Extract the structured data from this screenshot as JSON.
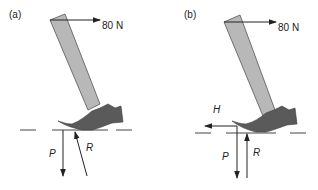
{
  "figure": {
    "colors": {
      "handle_fill": "#b8b8b8",
      "handle_stroke": "#555555",
      "head_fill": "#5a5a5a",
      "arrow": "#222222",
      "ground_dash": "#444444",
      "background": "#ffffff"
    },
    "panels": [
      {
        "id": "a",
        "label": "(a)",
        "applied_force": {
          "label": "80 N",
          "direction": "right"
        },
        "forces": [
          {
            "symbol": "P",
            "direction": "down"
          },
          {
            "symbol": "R",
            "direction": "up-left (inclined)"
          }
        ]
      },
      {
        "id": "b",
        "label": "(b)",
        "applied_force": {
          "label": "80 N",
          "direction": "right"
        },
        "forces": [
          {
            "symbol": "H",
            "direction": "left"
          },
          {
            "symbol": "P",
            "direction": "down"
          },
          {
            "symbol": "R",
            "direction": "up"
          }
        ]
      }
    ]
  }
}
